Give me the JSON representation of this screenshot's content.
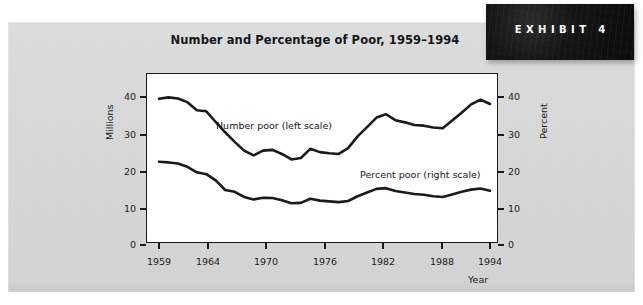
{
  "exhibit": {
    "label": "EXHIBIT 4"
  },
  "chart_data": {
    "type": "line",
    "title": "Number and Percentage of Poor, 1959–1994",
    "xlabel": "Year",
    "ylabel": "Millions",
    "y2label": "Percent",
    "xlim": [
      1959,
      1994
    ],
    "ylim": [
      0,
      45
    ],
    "y2lim": [
      0,
      45
    ],
    "yticks": [
      0,
      10,
      20,
      30,
      40
    ],
    "y2ticks": [
      0,
      10,
      20,
      30,
      40
    ],
    "xticks": [
      1959,
      1964,
      1970,
      1976,
      1982,
      1988,
      1994
    ],
    "grid": false,
    "legend": "inline-annotations",
    "annotations": [
      "Number poor (left scale)",
      "Percent poor (right scale)"
    ],
    "x": [
      1959,
      1960,
      1961,
      1962,
      1963,
      1964,
      1965,
      1966,
      1967,
      1968,
      1969,
      1970,
      1971,
      1972,
      1973,
      1974,
      1975,
      1976,
      1977,
      1978,
      1979,
      1980,
      1981,
      1982,
      1983,
      1984,
      1985,
      1986,
      1987,
      1988,
      1989,
      1990,
      1991,
      1992,
      1993,
      1994
    ],
    "series": [
      {
        "name": "Number poor (left scale)",
        "axis": "left",
        "unit": "millions",
        "values": [
          39.5,
          39.9,
          39.6,
          38.6,
          36.4,
          36.1,
          33.2,
          30.4,
          27.8,
          25.4,
          24.1,
          25.4,
          25.6,
          24.5,
          23.0,
          23.4,
          25.9,
          25.0,
          24.7,
          24.5,
          26.1,
          29.3,
          31.8,
          34.4,
          35.3,
          33.7,
          33.1,
          32.4,
          32.2,
          31.7,
          31.5,
          33.6,
          35.7,
          38.0,
          39.3,
          38.1
        ]
      },
      {
        "name": "Percent poor (right scale)",
        "axis": "right",
        "unit": "percent",
        "values": [
          22.4,
          22.2,
          21.9,
          21.0,
          19.5,
          19.0,
          17.3,
          14.7,
          14.2,
          12.8,
          12.1,
          12.6,
          12.5,
          11.9,
          11.1,
          11.2,
          12.3,
          11.8,
          11.6,
          11.4,
          11.7,
          13.0,
          14.0,
          15.0,
          15.2,
          14.4,
          14.0,
          13.6,
          13.4,
          13.0,
          12.8,
          13.5,
          14.2,
          14.8,
          15.1,
          14.5
        ]
      }
    ]
  },
  "colors": {
    "line": "#1a1a1a",
    "plot_background": "#ffffff",
    "page_background": "#d8d8d8",
    "badge_background": "#0d0d0d",
    "badge_text": "#ffffff",
    "text": "#15151a"
  }
}
